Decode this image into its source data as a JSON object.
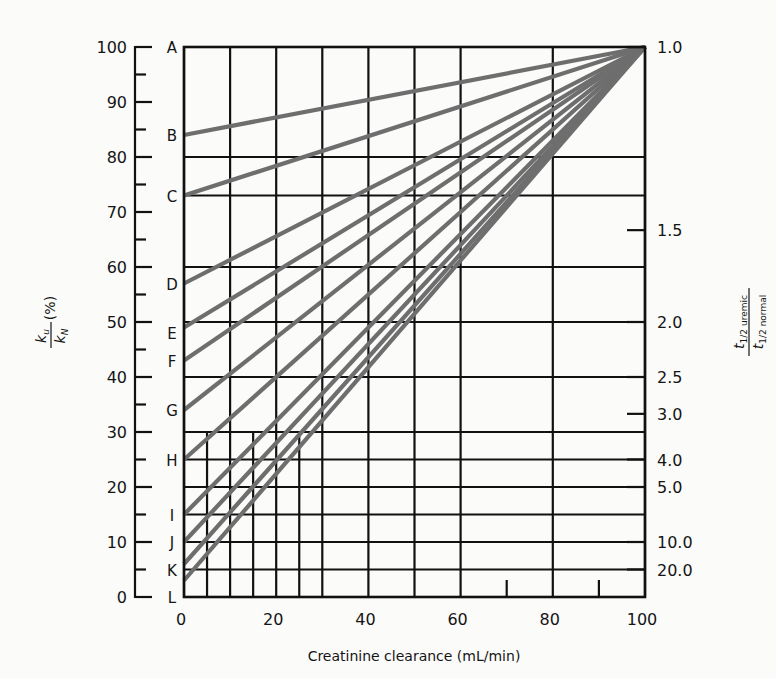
{
  "chart_data": {
    "type": "line",
    "title": "",
    "xlabel": "Creatinine clearance (mL/min)",
    "ylabel_left": {
      "numerator": "k",
      "numerator_sub": "u",
      "denominator": "k",
      "denominator_sub": "N",
      "unit": "(%)"
    },
    "ylabel_right": {
      "numerator": "t",
      "numerator_sub": "1/2 uremic",
      "denominator": "t",
      "denominator_sub": "1/2 normal"
    },
    "xlim": [
      0,
      100
    ],
    "ylim": [
      0,
      100
    ],
    "x_ticks": [
      0,
      20,
      40,
      60,
      80,
      100
    ],
    "x_tick_labels": [
      "0",
      "20",
      "40",
      "60",
      "80",
      "100"
    ],
    "y_ticks_left": [
      0,
      10,
      20,
      30,
      40,
      50,
      60,
      70,
      80,
      90,
      100
    ],
    "y_tick_labels_left": [
      "0",
      "10",
      "20",
      "30",
      "40",
      "50",
      "60",
      "70",
      "80",
      "90",
      "100"
    ],
    "y_minor_ticks_left": [
      5,
      15,
      25,
      35,
      45,
      55,
      65,
      75,
      85,
      95
    ],
    "right_axis_ticks": [
      {
        "label": "1.0",
        "y": 100
      },
      {
        "label": "1.5",
        "y": 66.7
      },
      {
        "label": "2.0",
        "y": 50
      },
      {
        "label": "2.5",
        "y": 40
      },
      {
        "label": "3.0",
        "y": 33.3
      },
      {
        "label": "4.0",
        "y": 25
      },
      {
        "label": "5.0",
        "y": 20
      },
      {
        "label": "10.0",
        "y": 10
      },
      {
        "label": "20.0",
        "y": 5
      }
    ],
    "grid": {
      "vertical_full": [
        0,
        10,
        20,
        30,
        40,
        50,
        60,
        80,
        100
      ],
      "vertical_lower_only": [
        5,
        15,
        25
      ],
      "vertical_short_ticks": [
        70,
        90
      ],
      "horizontal": [
        0,
        5,
        10,
        15,
        20,
        25,
        30,
        40,
        50,
        60,
        73,
        80,
        100
      ]
    },
    "series": [
      {
        "name": "A",
        "x": [
          0,
          100
        ],
        "y": [
          100,
          100
        ]
      },
      {
        "name": "B",
        "x": [
          0,
          100
        ],
        "y": [
          84,
          100
        ]
      },
      {
        "name": "C",
        "x": [
          0,
          100
        ],
        "y": [
          73,
          100
        ]
      },
      {
        "name": "D",
        "x": [
          0,
          100
        ],
        "y": [
          57,
          100
        ]
      },
      {
        "name": "E",
        "x": [
          0,
          100
        ],
        "y": [
          49,
          100
        ]
      },
      {
        "name": "F",
        "x": [
          0,
          100
        ],
        "y": [
          43,
          100
        ]
      },
      {
        "name": "G",
        "x": [
          0,
          100
        ],
        "y": [
          34,
          100
        ]
      },
      {
        "name": "H",
        "x": [
          0,
          100
        ],
        "y": [
          25,
          100
        ]
      },
      {
        "name": "I",
        "x": [
          0,
          100
        ],
        "y": [
          15,
          100
        ]
      },
      {
        "name": "J",
        "x": [
          0,
          100
        ],
        "y": [
          10,
          100
        ]
      },
      {
        "name": "K",
        "x": [
          0,
          100
        ],
        "y": [
          6,
          100
        ]
      },
      {
        "name": "L",
        "x": [
          0,
          100
        ],
        "y": [
          3,
          100
        ]
      }
    ],
    "series_label_positions": {
      "A": 100,
      "B": 84,
      "C": 73,
      "D": 57,
      "E": 48,
      "F": 43,
      "G": 34,
      "H": 25,
      "I": 15,
      "J": 10,
      "K": 5,
      "L": 0
    },
    "line_color": "#6e6e6e",
    "grid_color": "#111111",
    "legend": "none"
  }
}
